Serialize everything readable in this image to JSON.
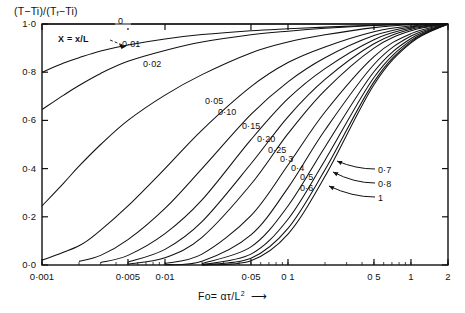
{
  "figure": {
    "ylabel_parts": {
      "a": "(T−Ti)/(T",
      "b": "f",
      "c": "−Ti)"
    },
    "xlabel_parts": {
      "a": "Fo= ατ/L",
      "b": "2",
      "arrow": "⟶"
    },
    "annotation": "X = x/L"
  },
  "chart_data": {
    "type": "line",
    "title": "",
    "subtitle": "",
    "xlabel": "Fo = ατ/L²",
    "ylabel": "(T−Ti)/(Tf−Ti)",
    "xscale": "log",
    "yscale": "linear",
    "xlim": [
      0.001,
      2
    ],
    "ylim": [
      0.0,
      1.0
    ],
    "grid": false,
    "legend": "inline-curve-labels",
    "xticks_labeled": [
      "0·001",
      "0·005",
      "0·01",
      "0·05",
      "0 1",
      "0 5",
      "1",
      "2"
    ],
    "xtick_values": [
      0.001,
      0.005,
      0.01,
      0.05,
      0.1,
      0.5,
      1,
      2
    ],
    "yticks_labeled": [
      "1·0",
      "0·8",
      "0·6",
      "0·4",
      "0·2",
      "0·0"
    ],
    "ytick_values": [
      1.0,
      0.8,
      0.6,
      0.4,
      0.2,
      0.0
    ],
    "series_param": "X = x/L",
    "series": [
      {
        "name": "0",
        "label": "0",
        "label_style": "top-axis",
        "x": [
          0.001,
          0.0015,
          0.002,
          0.003,
          0.005,
          0.01,
          0.02,
          0.05,
          0.1,
          0.2,
          0.5,
          1,
          2
        ],
        "y": [
          1.0,
          1.0,
          1.0,
          1.0,
          1.0,
          1.0,
          1.0,
          1.0,
          1.0,
          1.0,
          1.0,
          1.0,
          1.0
        ]
      },
      {
        "name": "0.01",
        "label": "0·01",
        "label_style": "on-curve",
        "x": [
          0.001,
          0.0015,
          0.002,
          0.003,
          0.005,
          0.01,
          0.02,
          0.05,
          0.1,
          0.2,
          0.5,
          1,
          2
        ],
        "y": [
          0.8,
          0.838,
          0.86,
          0.888,
          0.913,
          0.938,
          0.956,
          0.972,
          0.98,
          0.987,
          0.995,
          0.999,
          1.0
        ]
      },
      {
        "name": "0.02",
        "label": "0·02",
        "label_style": "on-curve",
        "x": [
          0.001,
          0.0015,
          0.002,
          0.003,
          0.005,
          0.01,
          0.02,
          0.05,
          0.1,
          0.2,
          0.5,
          1,
          2
        ],
        "y": [
          0.645,
          0.705,
          0.745,
          0.795,
          0.845,
          0.89,
          0.925,
          0.955,
          0.97,
          0.982,
          0.994,
          0.999,
          1.0
        ]
      },
      {
        "name": "0.05",
        "label": "0·05",
        "label_style": "on-curve",
        "x": [
          0.001,
          0.0015,
          0.002,
          0.003,
          0.005,
          0.01,
          0.02,
          0.05,
          0.1,
          0.2,
          0.5,
          1,
          2
        ],
        "y": [
          0.245,
          0.34,
          0.41,
          0.5,
          0.6,
          0.705,
          0.79,
          0.88,
          0.925,
          0.955,
          0.985,
          0.997,
          1.0
        ]
      },
      {
        "name": "0.10",
        "label": "0·10",
        "label_style": "on-curve",
        "x": [
          0.001,
          0.002,
          0.003,
          0.005,
          0.01,
          0.02,
          0.05,
          0.1,
          0.2,
          0.5,
          1,
          2
        ],
        "y": [
          0.02,
          0.08,
          0.145,
          0.245,
          0.4,
          0.56,
          0.74,
          0.84,
          0.905,
          0.968,
          0.992,
          1.0
        ]
      },
      {
        "name": "0.15",
        "label": "0·15",
        "label_style": "on-curve",
        "x": [
          0.002,
          0.003,
          0.005,
          0.01,
          0.02,
          0.05,
          0.1,
          0.2,
          0.5,
          1,
          2
        ],
        "y": [
          0.015,
          0.04,
          0.105,
          0.235,
          0.4,
          0.625,
          0.76,
          0.86,
          0.952,
          0.988,
          1.0
        ]
      },
      {
        "name": "0.20",
        "label": "0·20",
        "label_style": "on-curve",
        "x": [
          0.003,
          0.005,
          0.01,
          0.02,
          0.05,
          0.1,
          0.2,
          0.5,
          1,
          2
        ],
        "y": [
          0.01,
          0.04,
          0.13,
          0.27,
          0.52,
          0.69,
          0.815,
          0.935,
          0.983,
          1.0
        ]
      },
      {
        "name": "0.25",
        "label": "0·25",
        "label_style": "on-curve",
        "x": [
          0.005,
          0.01,
          0.02,
          0.05,
          0.1,
          0.2,
          0.5,
          1,
          2
        ],
        "y": [
          0.012,
          0.065,
          0.18,
          0.42,
          0.615,
          0.77,
          0.918,
          0.978,
          1.0
        ]
      },
      {
        "name": "0.3",
        "label": "0·3",
        "label_style": "on-curve",
        "x": [
          0.005,
          0.01,
          0.02,
          0.05,
          0.1,
          0.2,
          0.5,
          1,
          2
        ],
        "y": [
          0.004,
          0.03,
          0.115,
          0.335,
          0.545,
          0.725,
          0.9,
          0.972,
          1.0
        ]
      },
      {
        "name": "0.4",
        "label": "0·4",
        "label_style": "on-curve",
        "x": [
          0.01,
          0.02,
          0.05,
          0.1,
          0.2,
          0.5,
          1,
          2
        ],
        "y": [
          0.006,
          0.045,
          0.205,
          0.415,
          0.635,
          0.865,
          0.96,
          1.0
        ]
      },
      {
        "name": "0.5",
        "label": "0·5",
        "label_style": "on-curve",
        "x": [
          0.01,
          0.02,
          0.05,
          0.1,
          0.2,
          0.5,
          1,
          2
        ],
        "y": [
          0.001,
          0.016,
          0.125,
          0.32,
          0.56,
          0.832,
          0.95,
          1.0
        ]
      },
      {
        "name": "0.6",
        "label": "0·6",
        "label_style": "on-curve",
        "x": [
          0.02,
          0.05,
          0.1,
          0.2,
          0.5,
          1,
          2
        ],
        "y": [
          0.006,
          0.075,
          0.245,
          0.49,
          0.802,
          0.94,
          1.0
        ]
      },
      {
        "name": "0.7",
        "label": "0·7",
        "label_style": "leader-right",
        "x": [
          0.02,
          0.05,
          0.1,
          0.2,
          0.5,
          1,
          2
        ],
        "y": [
          0.002,
          0.045,
          0.19,
          0.435,
          0.778,
          0.932,
          1.0
        ]
      },
      {
        "name": "0.8",
        "label": "0·8",
        "label_style": "leader-right",
        "x": [
          0.02,
          0.05,
          0.1,
          0.2,
          0.5,
          1,
          2
        ],
        "y": [
          0.001,
          0.028,
          0.152,
          0.395,
          0.76,
          0.926,
          1.0
        ]
      },
      {
        "name": "1",
        "label": "1",
        "label_style": "leader-right",
        "x": [
          0.02,
          0.05,
          0.1,
          0.2,
          0.5,
          1,
          2
        ],
        "y": [
          0.0,
          0.018,
          0.128,
          0.368,
          0.748,
          0.922,
          1.0
        ]
      }
    ],
    "curve_label_positions": [
      {
        "label": "0",
        "x": 118,
        "y": 17
      },
      {
        "label": "0·01",
        "x": 122,
        "y": 40
      },
      {
        "label": "0·02",
        "x": 143,
        "y": 60
      },
      {
        "label": "0·05",
        "x": 205,
        "y": 97
      },
      {
        "label": "0·10",
        "x": 218,
        "y": 108
      },
      {
        "label": "0·15",
        "x": 242,
        "y": 122
      },
      {
        "label": "0·20",
        "x": 257,
        "y": 135
      },
      {
        "label": "0·25",
        "x": 268,
        "y": 146
      },
      {
        "label": "0·3",
        "x": 280,
        "y": 155
      },
      {
        "label": "0·4",
        "x": 291,
        "y": 164
      },
      {
        "label": "0·5",
        "x": 300,
        "y": 173
      },
      {
        "label": "0·6",
        "x": 300,
        "y": 184
      },
      {
        "label": "0·7",
        "x": 378,
        "y": 166
      },
      {
        "label": "0·8",
        "x": 378,
        "y": 180
      },
      {
        "label": "1",
        "x": 378,
        "y": 194
      }
    ]
  }
}
